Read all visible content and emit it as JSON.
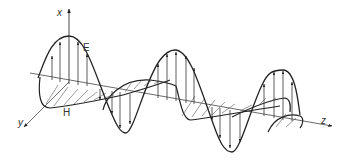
{
  "diagram": {
    "type": "electromagnetic-wave",
    "labels": {
      "x_axis": "x",
      "y_axis": "y",
      "z_axis": "z",
      "electric_field": "E",
      "magnetic_field": "H"
    },
    "colors": {
      "line": "#222222",
      "thin_line": "#555555",
      "background": "#ffffff"
    }
  }
}
